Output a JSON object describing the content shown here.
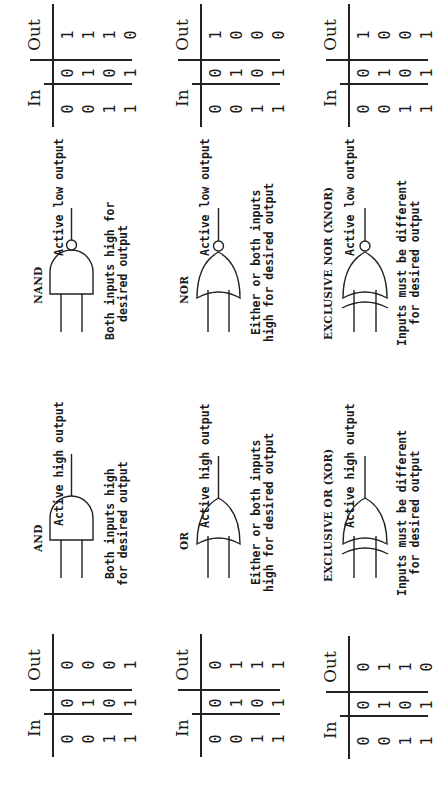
{
  "rows": [
    {
      "left": {
        "gate": "AND",
        "output_label": "Active high output",
        "caption_line1": "Both inputs high",
        "caption_line2": "for desired output",
        "table": {
          "in_header": "In",
          "out_header": "Out",
          "a": [
            "0",
            "0",
            "1",
            "1"
          ],
          "b": [
            "0",
            "1",
            "0",
            "1"
          ],
          "out": [
            "0",
            "0",
            "0",
            "1"
          ]
        }
      },
      "right": {
        "gate": "NAND",
        "output_label": "Active low output",
        "caption_line1": "Both inputs high for",
        "caption_line2": "desired output",
        "table": {
          "in_header": "In",
          "out_header": "Out",
          "a": [
            "0",
            "0",
            "1",
            "1"
          ],
          "b": [
            "0",
            "1",
            "0",
            "1"
          ],
          "out": [
            "1",
            "1",
            "1",
            "0"
          ]
        }
      }
    },
    {
      "left": {
        "gate": "OR",
        "output_label": "Active high output",
        "caption_line1": "Either or both inputs",
        "caption_line2": "high for desired output",
        "table": {
          "in_header": "In",
          "out_header": "Out",
          "a": [
            "0",
            "0",
            "1",
            "1"
          ],
          "b": [
            "0",
            "1",
            "0",
            "1"
          ],
          "out": [
            "0",
            "1",
            "1",
            "1"
          ]
        }
      },
      "right": {
        "gate": "NOR",
        "output_label": "Active low output",
        "caption_line1": "Either or both inputs",
        "caption_line2": "high for desired output",
        "table": {
          "in_header": "In",
          "out_header": "Out",
          "a": [
            "0",
            "0",
            "1",
            "1"
          ],
          "b": [
            "0",
            "1",
            "0",
            "1"
          ],
          "out": [
            "1",
            "0",
            "0",
            "0"
          ]
        }
      }
    },
    {
      "left": {
        "gate": "EXCLUSIVE OR (XOR)",
        "output_label": "Active high output",
        "caption_line1": "Inputs must be different",
        "caption_line2": "for desired output",
        "table": {
          "in_header": "In",
          "out_header": "Out",
          "a": [
            "0",
            "0",
            "1",
            "1"
          ],
          "b": [
            "0",
            "1",
            "0",
            "1"
          ],
          "out": [
            "0",
            "1",
            "1",
            "0"
          ]
        }
      },
      "right": {
        "gate": "EXCLUSIVE NOR (XNOR)",
        "output_label": "Active low output",
        "caption_line1": "Inputs must be different",
        "caption_line2": "for desired output",
        "table": {
          "in_header": "In",
          "out_header": "Out",
          "a": [
            "0",
            "0",
            "1",
            "1"
          ],
          "b": [
            "0",
            "1",
            "0",
            "1"
          ],
          "out": [
            "1",
            "0",
            "0",
            "1"
          ]
        }
      }
    }
  ]
}
